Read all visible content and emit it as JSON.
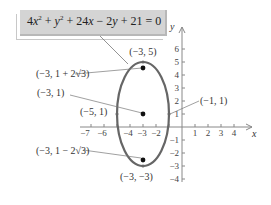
{
  "equation": {
    "display": "4x² + y² + 24x − 2y + 21 = 0",
    "parts": [
      "4",
      "x",
      "2",
      " + ",
      "y",
      "2",
      " + 24",
      "x",
      " − 2",
      "y",
      " + 21 = 0"
    ]
  },
  "axes": {
    "x_label": "x",
    "y_label": "y",
    "x_ticks": [
      "−7",
      "−6",
      "−4",
      "−3",
      "−2",
      "1",
      "2",
      "3",
      "4"
    ],
    "y_ticks": [
      "6",
      "5",
      "4",
      "3",
      "2",
      "1",
      "−1",
      "−2",
      "−3",
      "−4"
    ]
  },
  "ellipse": {
    "center": [
      -3,
      1
    ],
    "semi_axis_x": 2,
    "semi_axis_y": 4,
    "color": "#666666"
  },
  "points": {
    "top_vertex": {
      "label": "(−3, 5)",
      "coords": [
        -3,
        5
      ]
    },
    "upper_focus": {
      "label": "(−3, 1 + 2√3)",
      "coords": [
        -3,
        4.464
      ]
    },
    "center": {
      "label": "(−3, 1)",
      "coords": [
        -3,
        1
      ]
    },
    "left_covertex": {
      "label": "(−5, 1)",
      "coords": [
        -5,
        1
      ]
    },
    "right_covertex": {
      "label": "(−1, 1)",
      "coords": [
        -1,
        1
      ]
    },
    "lower_focus": {
      "label": "(−3, 1 − 2√3)",
      "coords": [
        -3,
        -2.464
      ]
    },
    "bottom_vertex": {
      "label": "(−3, −3)",
      "coords": [
        -3,
        -3
      ]
    }
  },
  "colors": {
    "equation_box": "#d4d4d4",
    "ellipse": "#666666",
    "axis": "#888888",
    "text": "#333333"
  }
}
